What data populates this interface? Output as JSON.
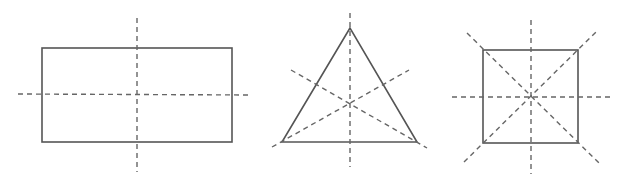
{
  "diagram": {
    "colors": {
      "shape_stroke": "#555555",
      "axis_stroke": "#666666",
      "background": "#ffffff"
    },
    "shapes": [
      {
        "name": "rectangle",
        "symmetry_lines": 2,
        "outline": {
          "x": 42,
          "y": 48,
          "width": 190,
          "height": 94
        },
        "axes": [
          {
            "x1": 137,
            "y1": 18,
            "x2": 137,
            "y2": 172
          },
          {
            "x1": 18,
            "y1": 94,
            "x2": 252,
            "y2": 95
          }
        ]
      },
      {
        "name": "equilateral-triangle",
        "symmetry_lines": 3,
        "outline": {
          "points": "350,28 282,142 417,142"
        },
        "axes": [
          {
            "x1": 350,
            "y1": 13,
            "x2": 350,
            "y2": 167
          },
          {
            "x1": 272,
            "y1": 147,
            "x2": 409,
            "y2": 70
          },
          {
            "x1": 291,
            "y1": 70,
            "x2": 427,
            "y2": 148
          }
        ]
      },
      {
        "name": "square",
        "symmetry_lines": 4,
        "outline": {
          "x": 483,
          "y": 50,
          "width": 95,
          "height": 93
        },
        "axes": [
          {
            "x1": 531,
            "y1": 20,
            "x2": 531,
            "y2": 174
          },
          {
            "x1": 452,
            "y1": 97,
            "x2": 610,
            "y2": 97
          },
          {
            "x1": 467,
            "y1": 33,
            "x2": 600,
            "y2": 164
          },
          {
            "x1": 464,
            "y1": 162,
            "x2": 598,
            "y2": 30
          }
        ]
      }
    ]
  }
}
